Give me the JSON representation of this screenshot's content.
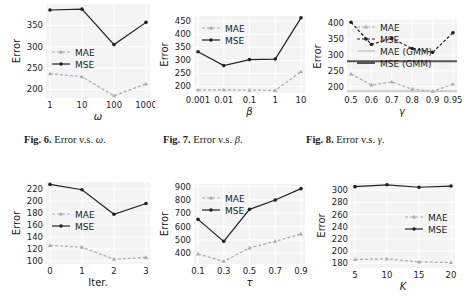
{
  "captions": [
    {
      "fig": "Fig. 6.",
      "text": "Error v.s. ",
      "sym": "ω",
      "end": "."
    },
    {
      "fig": "Fig. 7.",
      "text": "Error v.s. ",
      "sym": "β",
      "end": "."
    },
    {
      "fig": "Fig. 8.",
      "text": "Error v.s. ",
      "sym": "γ",
      "end": "."
    }
  ],
  "chart_data": [
    {
      "type": "line",
      "title": "",
      "xlabel": "ω",
      "ylabel": "Error",
      "categories": [
        "1",
        "10",
        "100",
        "1000"
      ],
      "yticks": [
        200,
        250,
        300,
        350
      ],
      "ylim": [
        180,
        400
      ],
      "series": [
        {
          "name": "MAE",
          "values": [
            237,
            230,
            185,
            213
          ],
          "style": "dashed",
          "color": "#aaaaaa",
          "marker": "triangle"
        },
        {
          "name": "MSE",
          "values": [
            386,
            388,
            305,
            357
          ],
          "style": "solid",
          "color": "#222222",
          "marker": "dot"
        }
      ],
      "legend": {
        "position": "center-left",
        "entries": [
          "MAE",
          "MSE"
        ]
      },
      "grid": true
    },
    {
      "type": "line",
      "title": "",
      "xlabel": "β",
      "ylabel": "Error",
      "categories": [
        "0.001",
        "0.01",
        "0.1",
        "1",
        "10"
      ],
      "yticks": [
        200,
        250,
        300,
        350,
        400,
        450
      ],
      "ylim": [
        175,
        470
      ],
      "series": [
        {
          "name": "MAE",
          "values": [
            187,
            187,
            186,
            185,
            257
          ],
          "style": "dashed",
          "color": "#aaaaaa",
          "marker": "triangle"
        },
        {
          "name": "MSE",
          "values": [
            333,
            280,
            303,
            305,
            463
          ],
          "style": "solid",
          "color": "#222222",
          "marker": "dot"
        }
      ],
      "legend": {
        "position": "upper-left",
        "entries": [
          "MAE",
          "MSE"
        ]
      },
      "grid": true
    },
    {
      "type": "line",
      "title": "",
      "xlabel": "γ",
      "ylabel": "Error",
      "categories": [
        "0.5",
        "0.6",
        "0.7",
        "0.8",
        "0.9",
        "0.95"
      ],
      "yticks": [
        200,
        250,
        300,
        350,
        400
      ],
      "ylim": [
        180,
        410
      ],
      "series": [
        {
          "name": "MAE",
          "values": [
            240,
            205,
            215,
            192,
            185,
            208
          ],
          "style": "dashed",
          "color": "#aaaaaa",
          "marker": "triangle"
        },
        {
          "name": "MSE",
          "values": [
            403,
            333,
            352,
            320,
            308,
            370
          ],
          "style": "dashed",
          "color": "#222222",
          "marker": "dot"
        },
        {
          "name": "MAE (GMM)",
          "values": [
            186,
            186,
            186,
            186,
            186,
            186
          ],
          "style": "solid",
          "color": "#bbbbbb",
          "marker": "none"
        },
        {
          "name": "MSE (GMM)",
          "values": [
            280,
            280,
            280,
            280,
            280,
            280
          ],
          "style": "solid",
          "color": "#555555",
          "marker": "none"
        }
      ],
      "legend": {
        "position": "upper-left",
        "entries": [
          "MAE",
          "MSE",
          "MAE (GMM)",
          "MSE (GMM)"
        ]
      },
      "grid": true
    },
    {
      "type": "line",
      "title": "",
      "xlabel": "Iter.",
      "ylabel": "Error",
      "categories": [
        "0",
        "1",
        "2",
        "3"
      ],
      "yticks": [
        100,
        120,
        140,
        160,
        180,
        200,
        220
      ],
      "ylim": [
        95,
        232
      ],
      "series": [
        {
          "name": "MAE",
          "values": [
            126,
            123,
            103,
            106
          ],
          "style": "dashed",
          "color": "#aaaaaa",
          "marker": "triangle"
        },
        {
          "name": "MSE",
          "values": [
            228,
            219,
            178,
            196
          ],
          "style": "solid",
          "color": "#222222",
          "marker": "dot"
        }
      ],
      "legend": {
        "position": "center-left",
        "entries": [
          "MAE",
          "MSE"
        ]
      },
      "grid": true
    },
    {
      "type": "line",
      "title": "",
      "xlabel": "τ",
      "ylabel": "Error",
      "categories": [
        "0.1",
        "0.3",
        "0.5",
        "0.7",
        "0.9"
      ],
      "yticks": [
        400,
        500,
        600,
        700,
        800,
        900
      ],
      "ylim": [
        320,
        920
      ],
      "series": [
        {
          "name": "MAE",
          "values": [
            395,
            340,
            440,
            490,
            545
          ],
          "style": "dashed",
          "color": "#aaaaaa",
          "marker": "triangle"
        },
        {
          "name": "MSE",
          "values": [
            655,
            490,
            730,
            800,
            885
          ],
          "style": "solid",
          "color": "#222222",
          "marker": "dot"
        }
      ],
      "legend": {
        "position": "upper-left",
        "entries": [
          "MAE",
          "MSE"
        ]
      },
      "grid": true
    },
    {
      "type": "line",
      "title": "",
      "xlabel": "K",
      "ylabel": "Error",
      "categories": [
        "5",
        "10",
        "15",
        "20"
      ],
      "yticks": [
        180,
        200,
        220,
        240,
        260,
        280,
        300
      ],
      "ylim": [
        172,
        312
      ],
      "series": [
        {
          "name": "MAE",
          "values": [
            186,
            187,
            182,
            181
          ],
          "style": "dashed",
          "color": "#aaaaaa",
          "marker": "triangle"
        },
        {
          "name": "MSE",
          "values": [
            306,
            309,
            305,
            307
          ],
          "style": "solid",
          "color": "#222222",
          "marker": "dot"
        }
      ],
      "legend": {
        "position": "center-right",
        "entries": [
          "MAE",
          "MSE"
        ]
      },
      "grid": true
    }
  ]
}
